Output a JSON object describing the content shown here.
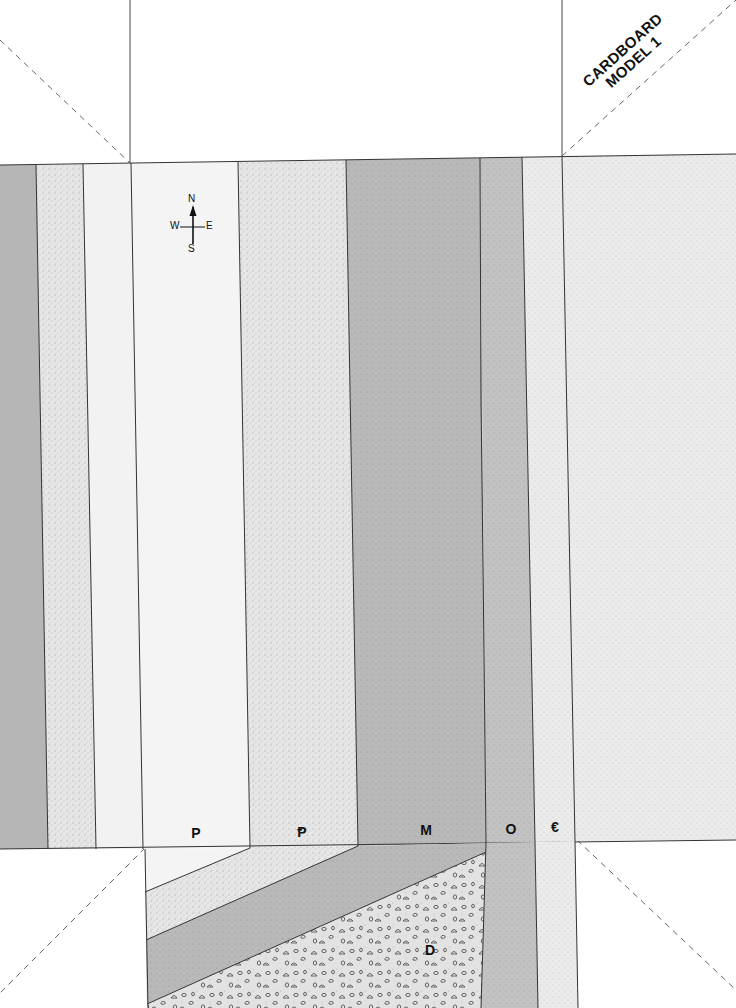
{
  "model_title": {
    "line1": "CARDBOARD",
    "line2": "MODEL 1"
  },
  "compass": {
    "north": "N",
    "south": "S",
    "west": "W",
    "east": "E",
    "icon": "compass-rose-icon"
  },
  "unit_labels": [
    {
      "id": "permian",
      "text": "P"
    },
    {
      "id": "pennsylvanian",
      "text": "Ᵽ"
    },
    {
      "id": "mississippian",
      "text": "M"
    },
    {
      "id": "ordovician",
      "text": "O"
    },
    {
      "id": "cambrian",
      "text": "€"
    },
    {
      "id": "devonian",
      "text": "D"
    }
  ],
  "colors": {
    "dark_gray": "#b4b4b4",
    "medium_gray": "#bdbdbd",
    "light_dotted": "#e4e4e4",
    "very_light": "#f2f2f2",
    "line": "#333333",
    "fold_dash": "#666666"
  }
}
